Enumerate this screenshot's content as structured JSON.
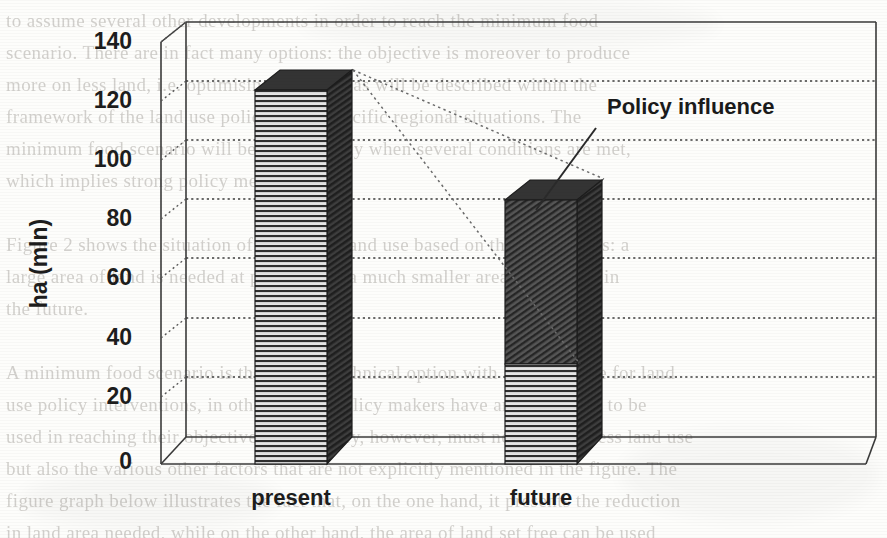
{
  "chart_data": {
    "type": "bar",
    "title": "",
    "subtitle": "",
    "xlabel": "",
    "ylabel": "ha (mln)",
    "categories": [
      "present",
      "future"
    ],
    "ylim": [
      0,
      140
    ],
    "yticks": [
      0,
      20,
      40,
      60,
      80,
      100,
      120,
      140
    ],
    "grid": true,
    "legend_position": "none",
    "stacked": true,
    "style": "3d-column",
    "series": [
      {
        "name": "remaining",
        "pattern": "horizontal-hatch",
        "values": [
          125,
          25
        ]
      },
      {
        "name": "policy-affected",
        "pattern": "diagonal-hatch-dark",
        "values": [
          0,
          55
        ]
      }
    ],
    "totals": [
      125,
      80
    ],
    "annotations": [
      {
        "text": "Policy influence",
        "x": 612,
        "y": 108,
        "leader_line": {
          "from_x": 592,
          "from_y": 128,
          "to_x": 538,
          "to_y": 208
        }
      }
    ],
    "connector_lines": [
      {
        "style": "dotted",
        "from": "present-top-back",
        "to": "future-top-back"
      },
      {
        "style": "dotted",
        "from": "present-top-front",
        "to": "future-segment-boundary"
      }
    ]
  },
  "axis": {
    "y_tick_labels": [
      "140",
      "120",
      "100",
      "80",
      "60",
      "40",
      "20",
      "0"
    ],
    "y_axis_title": "ha (mln)",
    "category_labels": [
      "present",
      "future"
    ]
  },
  "annotation": {
    "policy_influence": "Policy influence"
  },
  "colors": {
    "bar_light_fill": "#d8d8d8",
    "bar_light_hatch": "#3a3a3a",
    "bar_dark_fill": "#4a4a4a",
    "bar_dark_hatch": "#1e1e1e",
    "bar_side": "#3b3b3b",
    "bar_top": "#2f2f2f",
    "axis": "#2b2b2b",
    "gridline": "#4a4a4a",
    "text": "#1d1d1d",
    "paper": "#fdfdfb",
    "ghost_text": "#b9b6b1"
  },
  "background_text": {
    "note": "faint bleed-through text of the underlying scanned page",
    "lines": [
      "to  assume  several  other  developments  in  order  to  reach  the  minimum  food",
      "scenario.  There  are  in  fact  many  options:  the  objective  is  moreover  to  produce",
      "more  on  less  land,  i.e.  optimising  land  use,  as  will  be  described  within  the",
      "framework  of  the  land  use  policy  in  the  specific  regional  situations.  The",
      "minimum  food  scenario  will  be  reached  only  when  several  conditions  are  met,",
      "which  implies  strong  policy  measures.",
      "",
      "Figure  2  shows  the  situation  of  a  regional  land  use  based  on  these  scenarios:  a",
      "large  area  of  land  is  needed  at  present,  but  a  much  smaller  area  is  required  in",
      "the  future.",
      "",
      "A  minimum  food  scenario  is  therefore  a  technical  option  with  a  large  scope  for  land",
      "use  policy  interventions,  in  other  words,  policy  makers  have  an  instrument  to  be",
      "used  in  reaching  their  objectives.  The  policy,  however,  must  not  only  address  land  use",
      "but  also  the  various  other  factors  that  are  not  explicitly  mentioned  in  the  figure.  The",
      "figure  graph  below  illustrates  the  fact  that,  on  the  one  hand,  it  presents  the  reduction",
      "in  land  area  needed,  while  on  the  other  hand,  the  area  of  land  set  free  can  be  used"
    ]
  }
}
